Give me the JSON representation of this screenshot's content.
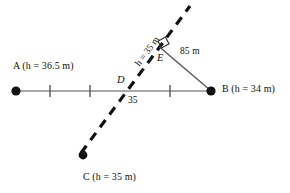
{
  "figure": {
    "colors": {
      "solid_line": "#8c8c8c",
      "dashed_line": "#111111",
      "text": "#111111",
      "background": "#ffffff"
    },
    "points": [
      {
        "id": "A",
        "label": "A (h = 36.5 m)",
        "name": "A",
        "height": "36.5 m",
        "x": 16,
        "y": 91
      },
      {
        "id": "B",
        "label": "B (h = 34 m)",
        "name": "B",
        "height": "34 m",
        "x": 211,
        "y": 91
      },
      {
        "id": "C",
        "label": "C (h = 35 m)",
        "name": "C",
        "height": "35 m",
        "x": 83,
        "y": 155
      },
      {
        "id": "D",
        "label": "D",
        "name": "D",
        "x": 131,
        "y": 91
      },
      {
        "id": "E",
        "label": "E",
        "name": "E",
        "x": 162,
        "y": 47
      }
    ],
    "labels": {
      "point_a": "A (h = 36.5 m)",
      "point_b": "B (h = 34 m)",
      "point_c": "C (h = 35 m)",
      "point_d": "D",
      "point_e": "E",
      "segment_be": "85 m",
      "contour": "h = 35 m",
      "angle_at_d": "35"
    },
    "measurements": [
      {
        "name": "85 m",
        "from": "B",
        "to": "E",
        "value": "85 m"
      },
      {
        "name": "h = 35 m",
        "on": "CE line",
        "value": "h = 35 m"
      },
      {
        "name": "angle",
        "at": "D",
        "value": "35"
      }
    ],
    "ticks": [
      {
        "x": 50
      },
      {
        "x": 90
      },
      {
        "x": 170
      }
    ],
    "lines": [
      {
        "name": "line-ab",
        "style": "solid",
        "x1": 16,
        "y1": 91,
        "x2": 211,
        "y2": 91
      },
      {
        "name": "line-cd-dashed",
        "style": "dashed",
        "x1": 83,
        "y1": 155,
        "x2": 190,
        "y2": 6
      },
      {
        "name": "line-be",
        "style": "solid",
        "x1": 211,
        "y1": 91,
        "x2": 160,
        "y2": 47
      }
    ]
  }
}
